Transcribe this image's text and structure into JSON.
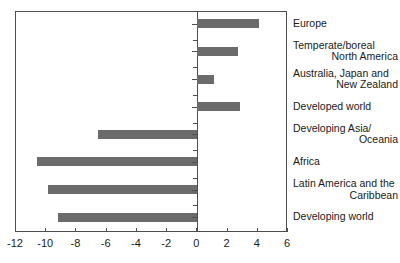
{
  "chart_data": {
    "type": "bar",
    "orientation": "horizontal",
    "title": "",
    "subtitle": "",
    "xlabel": "",
    "ylabel": "",
    "xlim": [
      -12,
      6
    ],
    "xticks": [
      -12,
      -10,
      -8,
      -6,
      -4,
      -2,
      0,
      2,
      4,
      6
    ],
    "xticklabels": [
      "-12",
      "-10",
      "-8",
      "-6",
      "-4",
      "-2",
      "0",
      "2",
      "4",
      "6"
    ],
    "grid": false,
    "legend": false,
    "zero_line": 0,
    "bar_color": "#6b6b6b",
    "frame_color": "#4d4d4d",
    "categories": [
      "Europe",
      "Temperate/boreal North America",
      "Australia, Japan and New Zealand",
      "Developed world",
      "Developing Asia/Oceania",
      "Africa",
      "Latin America and the Caribbean",
      "Developing world"
    ],
    "values": [
      4.1,
      2.7,
      1.1,
      2.8,
      -6.6,
      -10.6,
      -9.9,
      -9.2
    ],
    "points": [
      {
        "label_line1": "Europe",
        "label_line2": "",
        "value": 4.1
      },
      {
        "label_line1": "Temperate/boreal",
        "label_line2": "North America",
        "value": 2.7
      },
      {
        "label_line1": "Australia, Japan and",
        "label_line2": "New Zealand",
        "value": 1.1
      },
      {
        "label_line1": "Developed world",
        "label_line2": "",
        "value": 2.8
      },
      {
        "label_line1": "Developing Asia/",
        "label_line2": "Oceania",
        "value": -6.6
      },
      {
        "label_line1": "Africa",
        "label_line2": "",
        "value": -10.6
      },
      {
        "label_line1": "Latin America and the",
        "label_line2": "Caribbean",
        "value": -9.9
      },
      {
        "label_line1": "Developing world",
        "label_line2": "",
        "value": -9.2
      }
    ]
  }
}
